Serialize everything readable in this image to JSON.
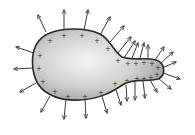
{
  "diagram": {
    "title": "Charged conductor with surface charges and electric field lines",
    "conductor": {
      "shape": "pear-shaped irregular conductor",
      "fill_light": "#f4f4f4",
      "fill_dark": "#9a9a9a",
      "outline_color": "#2a2a2a"
    },
    "charge_symbol": "+",
    "charge_color": "#333333",
    "field_line_color": "#3a3a3a",
    "charges": [
      [
        50,
        40
      ],
      [
        64,
        35
      ],
      [
        82,
        35
      ],
      [
        97,
        40
      ],
      [
        108,
        48
      ],
      [
        40,
        55
      ],
      [
        39,
        68
      ],
      [
        43,
        81
      ],
      [
        55,
        91
      ],
      [
        68,
        96
      ],
      [
        85,
        96
      ],
      [
        101,
        92
      ],
      [
        115,
        83
      ],
      [
        118,
        60
      ],
      [
        128,
        63
      ],
      [
        136,
        63
      ],
      [
        144,
        62
      ],
      [
        152,
        63
      ],
      [
        158,
        67
      ],
      [
        157,
        74
      ],
      [
        151,
        77
      ],
      [
        144,
        78
      ],
      [
        137,
        78
      ],
      [
        127,
        80
      ]
    ],
    "field_lines": [
      {
        "x1": 46,
        "y1": 32,
        "x2": 38,
        "y2": 15
      },
      {
        "x1": 64,
        "y1": 29,
        "x2": 64,
        "y2": 10
      },
      {
        "x1": 84,
        "y1": 30,
        "x2": 88,
        "y2": 10
      },
      {
        "x1": 100,
        "y1": 35,
        "x2": 110,
        "y2": 17
      },
      {
        "x1": 110,
        "y1": 42,
        "x2": 124,
        "y2": 26
      },
      {
        "x1": 117,
        "y1": 54,
        "x2": 131,
        "y2": 37
      },
      {
        "x1": 124,
        "y1": 58,
        "x2": 135,
        "y2": 41
      },
      {
        "x1": 132,
        "y1": 58,
        "x2": 138,
        "y2": 43
      },
      {
        "x1": 140,
        "y1": 58,
        "x2": 144,
        "y2": 43
      },
      {
        "x1": 148,
        "y1": 58,
        "x2": 148,
        "y2": 45
      },
      {
        "x1": 155,
        "y1": 60,
        "x2": 164,
        "y2": 47
      },
      {
        "x1": 160,
        "y1": 64,
        "x2": 173,
        "y2": 52
      },
      {
        "x1": 162,
        "y1": 68,
        "x2": 176,
        "y2": 62
      },
      {
        "x1": 163,
        "y1": 73,
        "x2": 180,
        "y2": 79
      },
      {
        "x1": 158,
        "y1": 78,
        "x2": 171,
        "y2": 89
      },
      {
        "x1": 150,
        "y1": 80,
        "x2": 157,
        "y2": 92
      },
      {
        "x1": 143,
        "y1": 81,
        "x2": 145,
        "y2": 98
      },
      {
        "x1": 135,
        "y1": 82,
        "x2": 135,
        "y2": 100
      },
      {
        "x1": 126,
        "y1": 85,
        "x2": 127,
        "y2": 101
      },
      {
        "x1": 116,
        "y1": 90,
        "x2": 121,
        "y2": 105
      },
      {
        "x1": 102,
        "y1": 96,
        "x2": 107,
        "y2": 113
      },
      {
        "x1": 85,
        "y1": 99,
        "x2": 86,
        "y2": 118
      },
      {
        "x1": 66,
        "y1": 99,
        "x2": 64,
        "y2": 119
      },
      {
        "x1": 50,
        "y1": 96,
        "x2": 41,
        "y2": 112
      },
      {
        "x1": 36,
        "y1": 83,
        "x2": 20,
        "y2": 92
      },
      {
        "x1": 33,
        "y1": 68,
        "x2": 14,
        "y2": 69
      },
      {
        "x1": 34,
        "y1": 53,
        "x2": 16,
        "y2": 47
      }
    ]
  }
}
